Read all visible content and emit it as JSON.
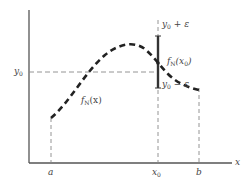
{
  "diagram": {
    "title": "",
    "axes": {
      "x_label": "x",
      "y_label": ""
    },
    "x_ticks": [
      {
        "id": "a",
        "label": "a"
      },
      {
        "id": "x0",
        "label": "x",
        "sub": "0"
      },
      {
        "id": "b",
        "label": "b"
      }
    ],
    "y_ticks": [
      {
        "id": "y0",
        "label": "y",
        "sub": "0"
      }
    ],
    "curve_label": {
      "prefix": "f",
      "sub": "N",
      "arg": "(x)"
    },
    "point_label": {
      "prefix": "f",
      "sub": "N",
      "arg_pre": "(x",
      "arg_sub": "0",
      "arg_post": ")"
    },
    "upper_bound_label": {
      "prefix": "y",
      "sub": "0",
      "suffix": " + ε"
    },
    "lower_bound_label": {
      "prefix": "y",
      "sub": "0",
      "suffix": " − ε"
    },
    "colors": {
      "axis": "#555555",
      "curve": "#222222",
      "guide": "#888888",
      "bar": "#333333"
    }
  }
}
